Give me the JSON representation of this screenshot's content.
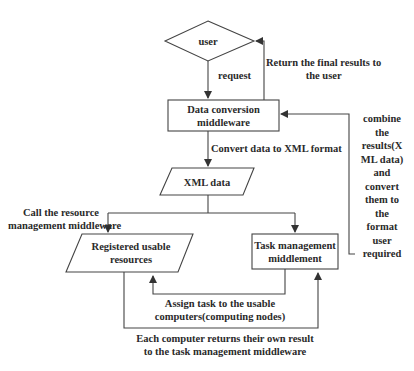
{
  "nodes": {
    "user": {
      "label": "user"
    },
    "data_conversion": {
      "line1": "Data conversion",
      "line2": "middleware"
    },
    "xml_data": {
      "label": "XML data"
    },
    "registered_resources": {
      "line1": "Registered usable",
      "line2": "resources"
    },
    "task_management": {
      "line1": "Task management",
      "line2": "middlement"
    }
  },
  "edges": {
    "request": {
      "label": "request"
    },
    "return_results": {
      "line1": "Return the final results to",
      "line2": "the user"
    },
    "convert_xml": {
      "label": "Convert data to XML format"
    },
    "combine": {
      "lines": [
        "combine",
        "the",
        "results(X",
        "ML data)",
        "and",
        "convert",
        "them to",
        "the",
        "format",
        "user",
        "required"
      ]
    },
    "call_resource": {
      "line1": "Call the resource",
      "line2": "management middleware"
    },
    "assign_task": {
      "line1": "Assign task to the usable",
      "line2": "computers(computing nodes)"
    },
    "each_returns": {
      "line1": "Each computer returns their own result",
      "line2": "to the task management middleware"
    }
  },
  "colors": {
    "stroke": "#444444",
    "text": "#2a2a2a",
    "background": "#ffffff"
  }
}
